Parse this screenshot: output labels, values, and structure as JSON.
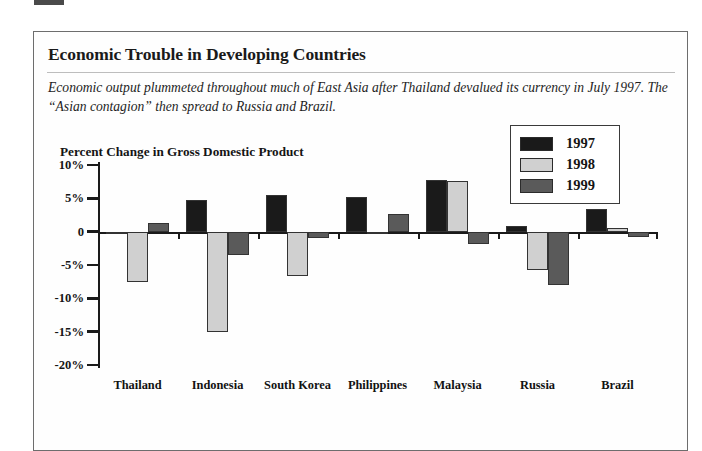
{
  "figure": {
    "headline": "Economic Trouble in Developing Countries",
    "deck": "Economic output plummeted throughout much of East Asia after Thailand devalued its currency in July 1997. The “Asian contagion” then spread to Russia and Brazil."
  },
  "colors": {
    "series_1997": "#1a1a1a",
    "series_1998": "#d0d0d0",
    "series_1999": "#5a5a5a",
    "axis": "#1a1a1a",
    "frame_border": "#6d6d6d",
    "page_background": "#ffffff"
  },
  "chart_data": {
    "type": "bar",
    "title": "Percent Change in Gross Domestic Product",
    "xlabel": "",
    "ylabel": "",
    "ylim": [
      -20,
      10
    ],
    "ytick_values": [
      10,
      5,
      0,
      -5,
      -10,
      -15,
      -20
    ],
    "ytick_labels": [
      "10%",
      "5%",
      "0",
      "-5%",
      "-10%",
      "-15%",
      "-20%"
    ],
    "grid": false,
    "legend_position": "top-right",
    "categories": [
      "Thailand",
      "Indonesia",
      "South Korea",
      "Philippines",
      "Malaysia",
      "Russia",
      "Brazil"
    ],
    "series": [
      {
        "name": "1997",
        "color": "#1a1a1a",
        "values": [
          -0.4,
          4.7,
          5.5,
          5.2,
          7.8,
          0.9,
          3.4
        ]
      },
      {
        "name": "1998",
        "color": "#d0d0d0",
        "values": [
          -7.6,
          -15.0,
          -6.7,
          -0.2,
          7.6,
          -5.7,
          0.5
        ]
      },
      {
        "name": "1999",
        "color": "#5a5a5a",
        "values": [
          1.3,
          -3.5,
          -1.0,
          2.7,
          -1.8,
          -8.0,
          -0.8
        ]
      }
    ]
  }
}
